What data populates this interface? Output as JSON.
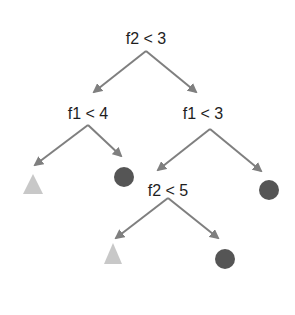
{
  "diagram": {
    "type": "decision-tree",
    "colors": {
      "edge": "#7f7f7f",
      "text": "#1e1e1e",
      "circle": "#555555",
      "triangle": "#c8c8c8"
    },
    "nodes": {
      "root": {
        "label": "f2 < 3"
      },
      "left": {
        "label": "f1 < 4"
      },
      "right": {
        "label": "f1 < 3"
      },
      "right_left": {
        "label": "f2 < 5"
      }
    },
    "leaves": [
      {
        "id": "leaf-left-left",
        "shape": "triangle",
        "parent": "f1 < 4"
      },
      {
        "id": "leaf-left-right",
        "shape": "circle",
        "parent": "f1 < 4"
      },
      {
        "id": "leaf-right-right",
        "shape": "circle",
        "parent": "f1 < 3"
      },
      {
        "id": "leaf-rl-left",
        "shape": "triangle",
        "parent": "f2 < 5"
      },
      {
        "id": "leaf-rl-right",
        "shape": "circle",
        "parent": "f2 < 5"
      }
    ]
  }
}
